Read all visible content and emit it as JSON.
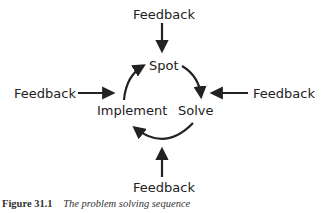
{
  "diagram": {
    "nodes": {
      "spot": "Spot",
      "solve": "Solve",
      "implement": "Implement"
    },
    "feedback": {
      "top": "Feedback",
      "left": "Feedback",
      "right": "Feedback",
      "bottom": "Feedback"
    },
    "cycle": [
      "Spot",
      "Solve",
      "Implement"
    ],
    "arrow_color": "#222222"
  },
  "caption": {
    "number": "Figure 31.1",
    "title": "The problem solving sequence"
  }
}
